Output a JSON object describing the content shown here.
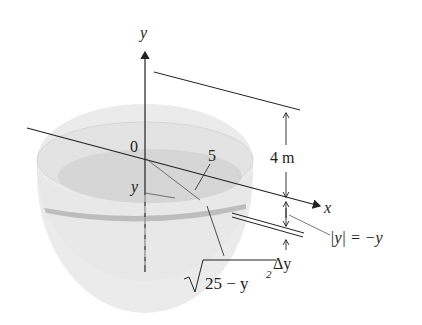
{
  "diagram": {
    "type": "hemispherical-tank-volume-slice",
    "axes": {
      "y_label": "y",
      "x_label": "x",
      "origin_label": "0"
    },
    "labels": {
      "radius": "5",
      "depth": "4 m",
      "y_level": "y",
      "abs_y": "|y| = −y",
      "delta_y": "Δy",
      "slice_radius_prefix": "25 − y",
      "slice_radius_exp": "2"
    },
    "colors": {
      "line": "#222222",
      "bowl_fill": "#e6e6e6",
      "water_fill": "#d3d3d3",
      "slice_band": "#bdbdbd",
      "background": "#ffffff"
    }
  }
}
